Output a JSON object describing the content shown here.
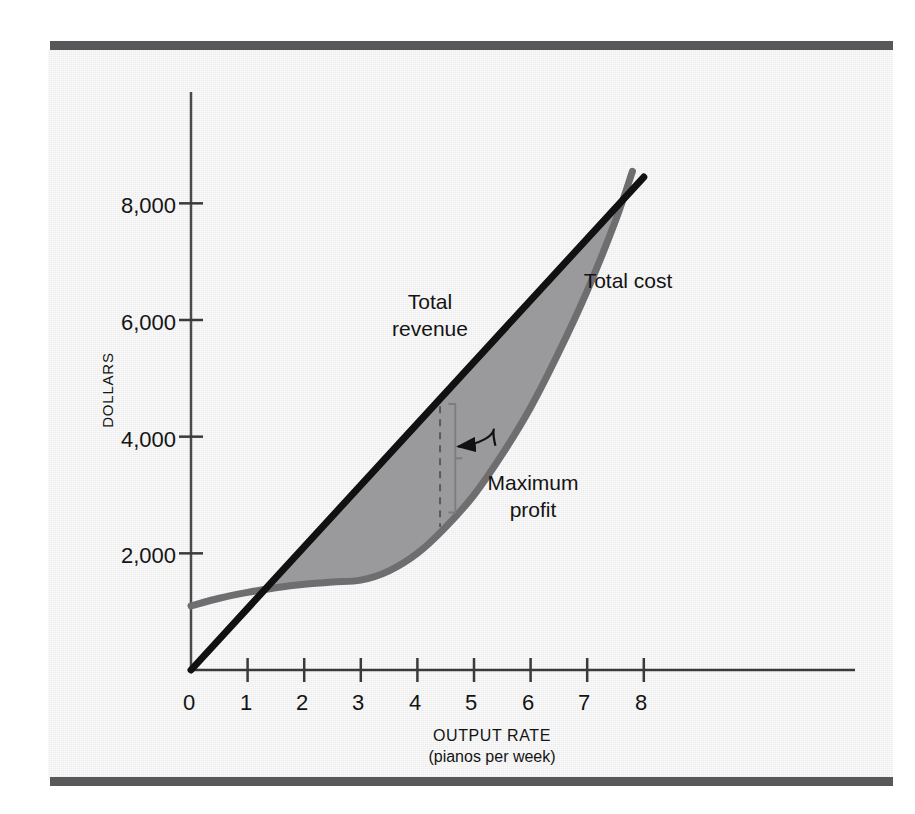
{
  "figure": {
    "background_color": "#ececec",
    "rule_color": "#58585a",
    "page_color": "#ffffff"
  },
  "chart_data": {
    "type": "line",
    "title": "",
    "subtitle": "",
    "xlabel": "OUTPUT RATE",
    "xlabel_sub": "(pianos per week)",
    "ylabel": "DOLLARS",
    "xlim": [
      0,
      8.4
    ],
    "ylim": [
      0,
      9000
    ],
    "grid": false,
    "legend_position": "inline-annotation",
    "x_ticks": [
      "0",
      "1",
      "2",
      "3",
      "4",
      "5",
      "6",
      "7",
      "8"
    ],
    "x_tick_values": [
      0,
      1,
      2,
      3,
      4,
      5,
      6,
      7,
      8
    ],
    "y_ticks": [
      "2,000",
      "4,000",
      "6,000",
      "8,000"
    ],
    "y_tick_values": [
      2000,
      4000,
      6000,
      8000
    ],
    "series": [
      {
        "name": "Total revenue",
        "color": "#111111",
        "width": 7,
        "style": "straight-line",
        "x": [
          0,
          8
        ],
        "values": [
          0,
          8450
        ]
      },
      {
        "name": "Total cost",
        "color": "#6e6e70",
        "width": 7,
        "style": "curve",
        "x": [
          0,
          0.5,
          1,
          1.5,
          2,
          2.5,
          3,
          3.5,
          4,
          4.5,
          5,
          5.5,
          6,
          6.5,
          7,
          7.5,
          7.8
        ],
        "values": [
          1100,
          1230,
          1330,
          1410,
          1470,
          1510,
          1540,
          1700,
          2000,
          2450,
          3000,
          3700,
          4500,
          5450,
          6500,
          7700,
          8550
        ]
      }
    ],
    "shaded_region": {
      "name": "profit-area",
      "color": "#9a9a9c",
      "between": [
        "Total revenue",
        "Total cost"
      ],
      "x_start": 1.15,
      "x_end": 7.62
    },
    "annotations": [
      {
        "name": "total-revenue-label",
        "text_lines": [
          "Total",
          "revenue"
        ],
        "x": 4.22,
        "y": 6250
      },
      {
        "name": "total-cost-label",
        "text_lines": [
          "Total cost"
        ],
        "x": 7.22,
        "y": 6730
      },
      {
        "name": "maximum-profit-label",
        "text_lines": [
          "Maximum",
          "profit"
        ],
        "x": 6.05,
        "y": 3330,
        "arrow_to_x": 4.72,
        "arrow_to_y": 3830
      },
      {
        "name": "max-profit-measure",
        "type": "dashed-vertical",
        "x": 4.4,
        "y_top": 4520,
        "y_bottom": 2450
      },
      {
        "name": "max-profit-bracket",
        "type": "bracket",
        "x": 4.67,
        "y_top": 4560,
        "y_bottom": 2700
      }
    ]
  },
  "labels": {
    "y_axis_title": "DOLLARS",
    "x_axis_title": "OUTPUT RATE",
    "x_axis_subtitle": "(pianos per week)",
    "total_revenue_line1": "Total",
    "total_revenue_line2": "revenue",
    "total_cost": "Total cost",
    "maximum_profit_line1": "Maximum",
    "maximum_profit_line2": "profit",
    "y0": "2,000",
    "y1": "4,000",
    "y2": "6,000",
    "y3": "8,000",
    "x0": "0",
    "x1": "1",
    "x2": "2",
    "x3": "3",
    "x4": "4",
    "x5": "5",
    "x6": "6",
    "x7": "7",
    "x8": "8"
  }
}
